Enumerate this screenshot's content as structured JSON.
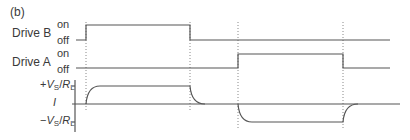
{
  "panel_label": "(b)",
  "signals": [
    {
      "name": "Drive B",
      "on_label": "on",
      "off_label": "off"
    },
    {
      "name": "Drive A",
      "on_label": "on",
      "off_label": "off"
    }
  ],
  "current_axis": {
    "label": "I",
    "pos_label": "+VS/RL",
    "neg_label": "−VS/RL"
  },
  "colors": {
    "trace": "#555555",
    "dotted": "#888888",
    "text": "#3a3a3a"
  }
}
